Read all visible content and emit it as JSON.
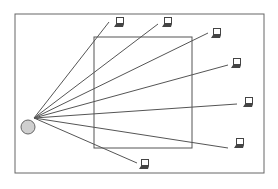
{
  "diagram": {
    "colors": {
      "background": "#ffffff",
      "stroke": "#555555",
      "node_fill": "#cfcfcf",
      "laptop": "#444444"
    },
    "source_node": {
      "name": "access-point",
      "shape": "circle"
    },
    "regions": [
      {
        "name": "outer-area",
        "shape": "rectangle"
      },
      {
        "name": "inner-area",
        "shape": "square"
      }
    ],
    "clients": [
      {
        "name": "laptop-1",
        "icon": "laptop-icon"
      },
      {
        "name": "laptop-2",
        "icon": "laptop-icon"
      },
      {
        "name": "laptop-3",
        "icon": "laptop-icon"
      },
      {
        "name": "laptop-4",
        "icon": "laptop-icon"
      },
      {
        "name": "laptop-5",
        "icon": "laptop-icon"
      },
      {
        "name": "laptop-6",
        "icon": "laptop-icon"
      },
      {
        "name": "laptop-7",
        "icon": "laptop-icon"
      }
    ]
  }
}
